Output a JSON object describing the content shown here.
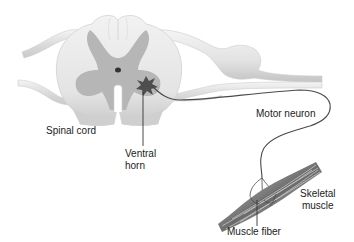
{
  "diagram": {
    "type": "anatomical illustration",
    "labels": {
      "spinal_cord": "Spinal cord",
      "ventral_horn_line1": "Ventral",
      "ventral_horn_line2": "horn",
      "motor_neuron": "Motor neuron",
      "skeletal_muscle_line1": "Skeletal",
      "skeletal_muscle_line2": "muscle",
      "muscle_fiber": "Muscle fiber"
    },
    "colors": {
      "white_matter": "#ececec",
      "gray_matter": "#b4b4b4",
      "nerve_root": "#e0e0e0",
      "neuron_body": "#555555",
      "axon": "#4a4a4a",
      "muscle_dark": "#7a7a7a",
      "muscle_light": "#c8c8c8",
      "label_text": "#222222"
    }
  }
}
